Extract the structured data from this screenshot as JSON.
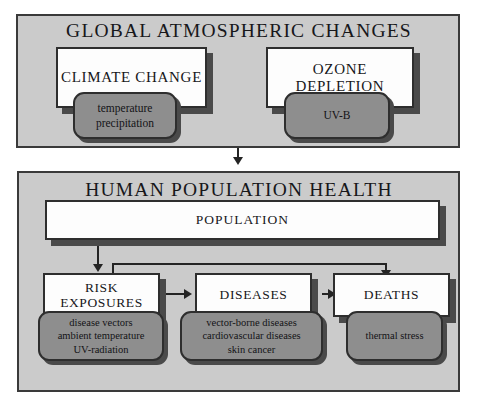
{
  "figure": {
    "type": "flow-diagram"
  },
  "panels": [
    {
      "id": "global",
      "title": "GLOBAL ATMOSPHERIC CHANGES",
      "boxes": [
        {
          "id": "climate",
          "header": "CLIMATE CHANGE",
          "items": [
            "temperature",
            "precipitation"
          ]
        },
        {
          "id": "ozone",
          "header": "OZONE DEPLETION",
          "items": [
            "UV-B"
          ]
        }
      ]
    },
    {
      "id": "human",
      "title": "HUMAN POPULATION HEALTH",
      "population": {
        "header": "POPULATION"
      },
      "boxes": [
        {
          "id": "risk",
          "header_line1": "RISK",
          "header_line2": "EXPOSURES",
          "items": [
            "disease vectors",
            "ambient temperature",
            "UV-radiation"
          ]
        },
        {
          "id": "diseases",
          "header_line1": "DISEASES",
          "header_line2": "",
          "items": [
            "vector-borne diseases",
            "cardiovascular diseases",
            "skin cancer"
          ]
        },
        {
          "id": "deaths",
          "header_line1": "DEATHS",
          "header_line2": "",
          "items": [
            "thermal stress"
          ]
        }
      ]
    }
  ],
  "connectors": [
    {
      "id": "global-to-human",
      "from": "global",
      "to": "human",
      "style": "arrow-down"
    },
    {
      "id": "population-to-risk",
      "from": "population",
      "to": "risk",
      "style": "arrow-down"
    },
    {
      "id": "population-to-deaths",
      "from": "population",
      "to": "deaths",
      "style": "elbow-arrow-down"
    },
    {
      "id": "risk-to-diseases",
      "from": "risk",
      "to": "diseases",
      "style": "arrow-right"
    },
    {
      "id": "diseases-to-deaths",
      "from": "diseases",
      "to": "deaths",
      "style": "arrow-right"
    }
  ],
  "colors": {
    "panel_fill": "#cbcbcb",
    "panel_border": "#3a3a3a",
    "white_box_fill": "#fdfdfd",
    "grey_box_fill": "#8e8e8e",
    "box_border": "#2e2e2e",
    "shadow": "#4a4a4a",
    "connector": "#242424",
    "text": "#17171a",
    "background": "#ffffff"
  }
}
